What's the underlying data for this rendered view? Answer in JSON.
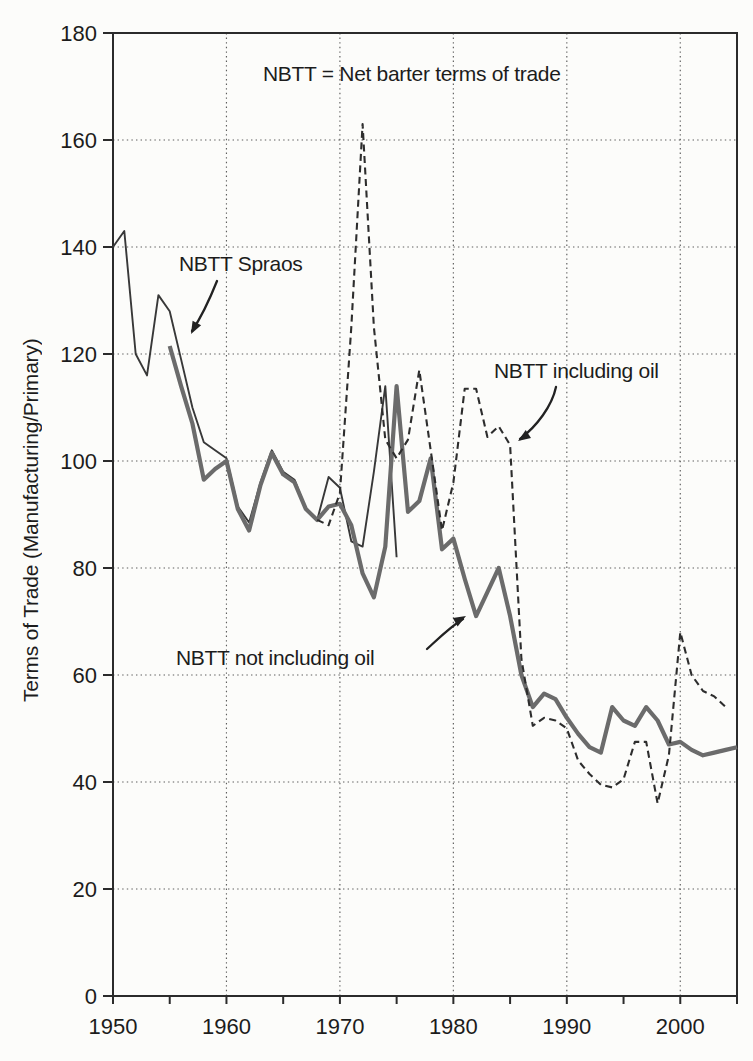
{
  "figure": {
    "background_color": "#fcfcfa",
    "text_color": "#1c1c1c",
    "frame_color": "#2b2b2b",
    "grid_color": "#4d4d4d"
  },
  "chart_data": {
    "type": "line",
    "title": "NBTT = Net barter terms of trade",
    "xlabel": "",
    "ylabel": "Terms of Trade (Manufacturing/Primary)",
    "xlim": [
      1950,
      2005
    ],
    "ylim": [
      0,
      180
    ],
    "x_ticks": [
      1950,
      1960,
      1970,
      1980,
      1990,
      2000
    ],
    "x_minor_tick_step": 5,
    "y_ticks": [
      0,
      20,
      40,
      60,
      80,
      100,
      120,
      140,
      160,
      180
    ],
    "grid": "dotted horizontal lines at each y tick, dotted vertical lines at each decade",
    "legend_position": "none (inline annotated labels with arrows)",
    "series": [
      {
        "name": "NBTT Spraos",
        "line_style": "solid-thin",
        "color": "#383838",
        "years": [
          1950,
          1951,
          1952,
          1953,
          1954,
          1955,
          1956,
          1957,
          1958,
          1959,
          1960,
          1961,
          1962,
          1963,
          1964,
          1965,
          1966,
          1967,
          1968,
          1969,
          1970,
          1971,
          1972,
          1973,
          1974,
          1975
        ],
        "values": [
          140,
          143,
          120,
          116,
          131,
          128,
          119,
          110,
          103.5,
          102,
          100.5,
          91.5,
          88.5,
          96,
          102,
          98,
          96.5,
          91,
          89,
          97,
          95,
          85,
          84,
          98,
          114,
          82
        ]
      },
      {
        "name": "NBTT not including oil",
        "line_style": "solid-thick",
        "color": "#6b6b6b",
        "years": [
          1955,
          1956,
          1957,
          1958,
          1959,
          1960,
          1961,
          1962,
          1963,
          1964,
          1965,
          1966,
          1967,
          1968,
          1969,
          1970,
          1971,
          1972,
          1973,
          1974,
          1975,
          1976,
          1977,
          1978,
          1979,
          1980,
          1981,
          1982,
          1983,
          1984,
          1985,
          1986,
          1987,
          1988,
          1989,
          1990,
          1991,
          1992,
          1993,
          1994,
          1995,
          1996,
          1997,
          1998,
          1999,
          2000,
          2001,
          2002,
          2003,
          2004,
          2005
        ],
        "values": [
          121.5,
          114,
          107,
          96.5,
          98.5,
          100,
          91,
          87,
          95.5,
          101.5,
          97.5,
          96,
          91,
          89,
          91.5,
          92,
          88,
          79,
          74.5,
          84,
          114,
          90.5,
          92.5,
          100.5,
          83.5,
          85.5,
          78,
          71,
          75.5,
          80,
          71,
          60,
          54,
          56.5,
          55.5,
          52,
          49,
          46.5,
          45.5,
          54,
          51.5,
          50.5,
          54,
          51.5,
          47,
          47.5,
          46,
          45,
          45.5,
          46,
          46.5
        ]
      },
      {
        "name": "NBTT including oil",
        "line_style": "dashed",
        "color": "#2d2d2d",
        "years": [
          1968,
          1969,
          1970,
          1971,
          1972,
          1973,
          1974,
          1975,
          1976,
          1977,
          1978,
          1979,
          1980,
          1981,
          1982,
          1983,
          1984,
          1985,
          1986,
          1987,
          1988,
          1989,
          1990,
          1991,
          1992,
          1993,
          1994,
          1995,
          1996,
          1997,
          1998,
          1999,
          2000,
          2001,
          2002,
          2003,
          2004
        ],
        "values": [
          89,
          88,
          94,
          125,
          163,
          125,
          104,
          100.5,
          104,
          117,
          102,
          87,
          96,
          113.5,
          113.5,
          104.5,
          106.5,
          103,
          63,
          50.5,
          52,
          51.5,
          50,
          44,
          41.5,
          39.5,
          39,
          40.5,
          47.5,
          47.5,
          36,
          45,
          68,
          60,
          57,
          56,
          54
        ]
      }
    ],
    "annotations": [
      {
        "text": "NBTT = Net barter terms of trade",
        "role": "title-note",
        "arrow": false
      },
      {
        "text": "NBTT Spraos",
        "role": "series-label",
        "arrow": true,
        "points_to": "NBTT Spraos line near 1956"
      },
      {
        "text": "NBTT including oil",
        "role": "series-label",
        "arrow": true,
        "points_to": "dashed line near 1985"
      },
      {
        "text": "NBTT not including oil",
        "role": "series-label",
        "arrow": true,
        "points_to": "thick line valley near 1982"
      }
    ]
  }
}
